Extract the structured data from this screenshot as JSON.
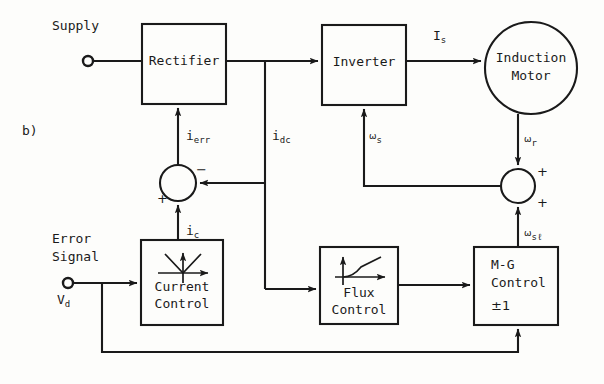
{
  "figure": {
    "part_label": "b)",
    "width": 604,
    "height": 384,
    "ink_color": "#1a1a1a",
    "background": "#fdfdfb"
  },
  "blocks": {
    "rectifier": {
      "label": "Rectifier",
      "x": 142,
      "y": 24,
      "w": 84,
      "h": 80
    },
    "inverter": {
      "label": "Inverter",
      "x": 322,
      "y": 25,
      "w": 84,
      "h": 80
    },
    "motor": {
      "label_line1": "Induction",
      "label_line2": "Motor",
      "cx": 531,
      "cy": 68,
      "r": 46
    },
    "current_control": {
      "label_line1": "Current",
      "label_line2": "Control",
      "x": 141,
      "y": 240,
      "w": 82,
      "h": 85
    },
    "flux_control": {
      "label_line1": "Flux",
      "label_line2": "Control",
      "x": 320,
      "y": 247,
      "w": 78,
      "h": 77
    },
    "mg_control": {
      "label_line1": "M-G",
      "label_line2": "Control",
      "label_line3": "±1",
      "x": 474,
      "y": 247,
      "w": 84,
      "h": 78
    }
  },
  "summing_junctions": {
    "current_error": {
      "cx": 178,
      "cy": 183,
      "r": 18,
      "sign_top_right": "−",
      "sign_bottom_left": "+"
    },
    "speed_sum": {
      "cx": 518,
      "cy": 186,
      "r": 17,
      "sign_top_right": "+",
      "sign_bottom_right": "+"
    }
  },
  "terminals": {
    "supply": {
      "label": "Supply",
      "cx": 88,
      "cy": 61,
      "r": 5
    },
    "error_signal": {
      "label_line1": "Error",
      "label_line2": "Signal",
      "value_label": "V",
      "value_sub": "d",
      "cx": 68,
      "cy": 283,
      "r": 5
    }
  },
  "signal_labels": [
    {
      "name": "i-err",
      "base": "i",
      "sub": "err",
      "x": 186,
      "y": 128
    },
    {
      "name": "i-dc",
      "base": "i",
      "sub": "dc",
      "x": 272,
      "y": 128
    },
    {
      "name": "i-c",
      "base": "i",
      "sub": "c",
      "x": 186,
      "y": 223
    },
    {
      "name": "I-s",
      "base": "I",
      "sub": "s",
      "x": 433,
      "y": 28
    },
    {
      "name": "omega-s",
      "base": "ω",
      "sub": "s",
      "x": 369,
      "y": 128
    },
    {
      "name": "omega-r",
      "base": "ω",
      "sub": "r",
      "x": 524,
      "y": 131
    },
    {
      "name": "omega-sl",
      "base": "ω",
      "sub": "sℓ",
      "x": 524,
      "y": 225
    }
  ]
}
